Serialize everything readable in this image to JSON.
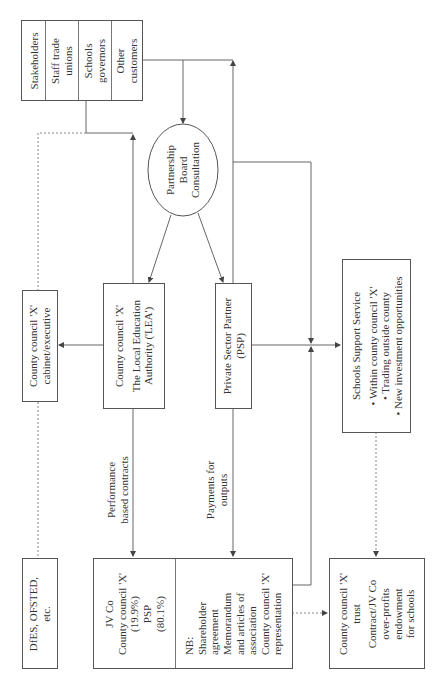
{
  "stakeholders": {
    "items": [
      "Stakeholders",
      "Staff trade unions",
      "Schools governors",
      "Other customers"
    ]
  },
  "partnership_board": {
    "lines": [
      "Partnership",
      "Board",
      "Consultation"
    ]
  },
  "cabinet": {
    "lines": [
      "County council 'X'",
      "cabinet/executive"
    ]
  },
  "lea": {
    "title": "County council 'X'",
    "lines": [
      "The Local Education",
      "Authority ('LEA')"
    ]
  },
  "psp": {
    "lines": [
      "Private Sector Partner",
      "(PSP)"
    ]
  },
  "schools_support": {
    "title": "Schools Support Service",
    "bullets": [
      "Within county council 'X'",
      "Trading outside county",
      "New investment opportunities"
    ]
  },
  "flows": {
    "performance": [
      "Performance",
      "based contracts"
    ],
    "payments": [
      "Payments for",
      "outputs"
    ]
  },
  "dfes": {
    "lines": [
      "DfES, OFSTED,",
      "etc."
    ]
  },
  "jvco": {
    "left_lines": [
      "JV Co",
      "County council 'X'",
      "(19.9%)",
      "PSP",
      "(80.1%)"
    ],
    "right_lines": [
      "NB:",
      "Shareholder",
      "agreement",
      "Memorandum",
      "and articles of",
      "association",
      "County council 'X'",
      "representation"
    ]
  },
  "trust": {
    "title": [
      "County council 'X'",
      "trust"
    ],
    "lines": [
      "Contract/JV Co",
      "over-profits",
      "endowment",
      "for schools"
    ]
  }
}
